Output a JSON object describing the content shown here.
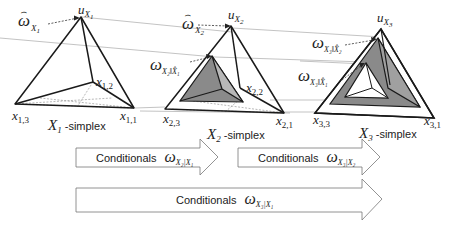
{
  "diagram": {
    "simplices": [
      {
        "id": "X1",
        "caption_var": "X",
        "caption_sub": "1",
        "caption_suffix": " -simplex",
        "apex_label": "u",
        "apex_sub": "X",
        "apex_subsub": "1",
        "vertices": [
          {
            "label": "x",
            "sub": "1,1"
          },
          {
            "label": "x",
            "sub": "1,2"
          },
          {
            "label": "x",
            "sub": "1,3"
          }
        ],
        "base_rate_label": "ω",
        "base_rate_sub": "X",
        "base_rate_subsub": "1"
      },
      {
        "id": "X2",
        "caption_var": "X",
        "caption_sub": "2",
        "caption_suffix": " -simplex",
        "apex_label": "u",
        "apex_sub": "X",
        "apex_subsub": "2",
        "vertices": [
          {
            "label": "x",
            "sub": "2,1"
          },
          {
            "label": "x",
            "sub": "2,2"
          },
          {
            "label": "x",
            "sub": "2,3"
          }
        ],
        "base_rate_label": "ω",
        "base_rate_sub": "X",
        "base_rate_subsub": "2",
        "derived_label": "ω",
        "derived_sub": "X₂‖X̂₁"
      },
      {
        "id": "X3",
        "caption_var": "X",
        "caption_sub": "3",
        "caption_suffix": " -simplex",
        "apex_label": "u",
        "apex_sub": "X",
        "apex_subsub": "3",
        "vertices": [
          {
            "label": "x",
            "sub": "3,1"
          },
          {
            "label": "x",
            "sub": "3,3"
          }
        ],
        "derived_labels": [
          {
            "label": "ω",
            "sub": "X₃‖X̂₂"
          },
          {
            "label": "ω",
            "sub": "X₃‖X̂₁"
          }
        ]
      }
    ],
    "arrows": [
      {
        "text": "Conditionals",
        "symbol": "ω",
        "sub": "X₂|X₁"
      },
      {
        "text": "Conditionals",
        "symbol": "ω",
        "sub": "X₃|X₂"
      },
      {
        "text": "Conditionals",
        "symbol": "ω",
        "sub": "X₃|X₁"
      }
    ],
    "colors": {
      "line": "#222222",
      "fill_gray": "#8a8a8a",
      "connector": "#999999"
    }
  }
}
